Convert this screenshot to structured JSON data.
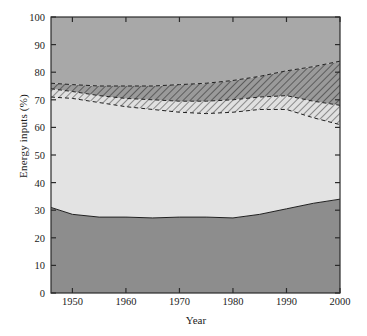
{
  "chart_data": {
    "type": "area",
    "title": "",
    "xlabel": "Year",
    "ylabel": "Energy inputs (%)",
    "xlim": [
      1946,
      2000
    ],
    "ylim": [
      0,
      100
    ],
    "grid": false,
    "legend_position": "inline-labels",
    "stacked": true,
    "x": [
      1946,
      1950,
      1955,
      1960,
      1965,
      1970,
      1975,
      1980,
      1985,
      1990,
      1995,
      2000
    ],
    "series": [
      {
        "name": "Transportation",
        "fill": "#8d8d8d",
        "label_x": 1973,
        "label_y": 13,
        "label_color": "#ffffff",
        "values": [
          31,
          28.5,
          27.5,
          27.5,
          27.2,
          27.5,
          27.5,
          27.2,
          28.5,
          30.5,
          32.5,
          34
        ]
      },
      {
        "name": "Industrial",
        "fill": "#e3e3e3",
        "label_x": 1966,
        "label_y": 46,
        "label_color": "#2a2a2a",
        "cumulative_top": [
          71,
          70.5,
          69,
          67.5,
          66.5,
          65.5,
          65,
          65.5,
          66.5,
          66.5,
          63.5,
          61
        ]
      },
      {
        "name": "hatch-band-lower",
        "fill": "hatched-light",
        "cumulative_top": [
          74,
          73,
          71.5,
          70.5,
          70,
          69.5,
          69.5,
          70,
          71,
          71.5,
          69.5,
          68
        ]
      },
      {
        "name": "hatch-band-upper",
        "fill": "hatched-dark",
        "cumulative_top": [
          76,
          75.5,
          75,
          75,
          75,
          75.5,
          76,
          77,
          78.5,
          80.5,
          82,
          84
        ]
      },
      {
        "name": "Household and commercial",
        "fill": "#a8a8a8",
        "label_x": 1971,
        "label_y": 80,
        "label_color": "#2a2a2a",
        "cumulative_top": [
          100,
          100,
          100,
          100,
          100,
          100,
          100,
          100,
          100,
          100,
          100,
          100
        ]
      }
    ],
    "yticks": [
      0,
      10,
      20,
      30,
      40,
      50,
      60,
      70,
      80,
      90,
      100
    ],
    "ytick_labels": [
      "0",
      "10",
      "20",
      "30",
      "40",
      "50",
      "60",
      "70",
      "80",
      "90",
      "100"
    ],
    "xticks": [
      1950,
      1960,
      1970,
      1980,
      1990,
      2000
    ],
    "xtick_labels": [
      "1950",
      "1960",
      "1970",
      "1980",
      "1990",
      "2000"
    ],
    "colors": {
      "household": "#a8a8a8",
      "industrial": "#e3e3e3",
      "transportation": "#8d8d8d",
      "axis": "#2b2b2b",
      "text": "#1b1b1b"
    }
  },
  "caption": ""
}
